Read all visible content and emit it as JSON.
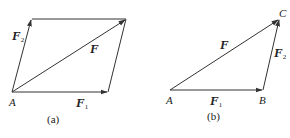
{
  "figure_a": {
    "caption": "(a)",
    "point_label": "A",
    "vectors": {
      "F": {
        "name": "F",
        "sub": ""
      },
      "F1": {
        "name": "F",
        "sub": "1"
      },
      "F2": {
        "name": "F",
        "sub": "2"
      }
    }
  },
  "figure_b": {
    "caption": "(b)",
    "points": {
      "A": "A",
      "B": "B",
      "C": "C"
    },
    "vectors": {
      "F": {
        "name": "F",
        "sub": ""
      },
      "F1": {
        "name": "F",
        "sub": "1"
      },
      "F2": {
        "name": "F",
        "sub": "2"
      }
    }
  },
  "colors": {
    "line": "#333333"
  }
}
